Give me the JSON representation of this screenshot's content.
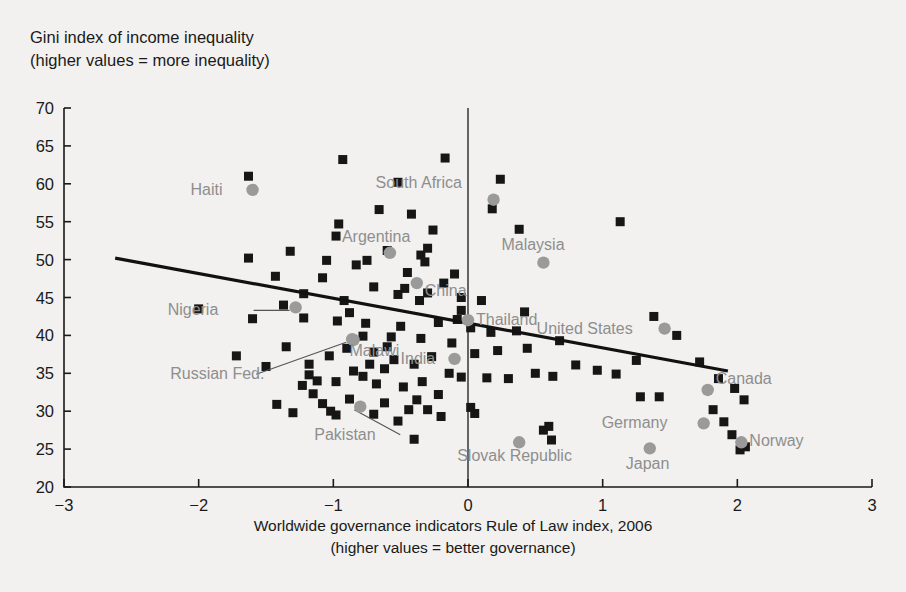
{
  "chart_data": {
    "type": "scatter",
    "title": "",
    "ylabel": "Gini index of income inequality\n(higher values = more inequality)",
    "xlabel": "Worldwide governance indicators Rule of Law index, 2006\n(higher values = better governance)",
    "xlim": [
      -3,
      3
    ],
    "ylim": [
      20,
      70
    ],
    "xticks": [
      -3,
      -2,
      -1,
      0,
      1,
      2,
      3
    ],
    "xtick_labels": [
      "−3",
      "−2",
      "−1",
      "0",
      "1",
      "2",
      "3"
    ],
    "yticks": [
      20,
      25,
      30,
      35,
      40,
      45,
      50,
      55,
      60,
      65,
      70
    ],
    "ytick_labels": [
      "20",
      "25",
      "30",
      "35",
      "40",
      "45",
      "50",
      "55",
      "60",
      "65",
      "70"
    ],
    "grid": false,
    "legend": "none",
    "zero_reference_line_x": 0,
    "trendline": {
      "type": "linear",
      "x_start": -2.62,
      "y_start": 50.2,
      "x_end": 1.93,
      "y_end": 35.3,
      "color": "#111111"
    },
    "marker_colors": {
      "unlabeled": "#161616",
      "highlighted": "#9a9a9a",
      "label_text": "#8e8e8e"
    },
    "labeled_points": [
      {
        "name": "Haiti",
        "x": -1.6,
        "y": 59.2,
        "label_dx": -62,
        "label_dy": 5,
        "anchor": "start",
        "leader": false
      },
      {
        "name": "Argentina",
        "x": -0.58,
        "y": 50.9,
        "label_dx": -48,
        "label_dy": -11,
        "anchor": "start",
        "leader": false
      },
      {
        "name": "South Africa",
        "x": 0.19,
        "y": 57.9,
        "label_dx": -118,
        "label_dy": -12,
        "anchor": "start",
        "leader": false
      },
      {
        "name": "Malaysia",
        "x": 0.56,
        "y": 49.6,
        "label_dx": -42,
        "label_dy": -13,
        "anchor": "start",
        "leader": false
      },
      {
        "name": "China",
        "x": -0.38,
        "y": 46.9,
        "label_dx": 8,
        "label_dy": 13,
        "anchor": "start",
        "leader": false
      },
      {
        "name": "Nigeria",
        "x": -1.28,
        "y": 43.7,
        "label_dx": -128,
        "label_dy": 8,
        "anchor": "start",
        "leader": true
      },
      {
        "name": "Thailand",
        "x": 0.0,
        "y": 42.0,
        "label_dx": 8,
        "label_dy": 5,
        "anchor": "start",
        "leader": false
      },
      {
        "name": "United States",
        "x": 1.46,
        "y": 40.9,
        "label_dx": -128,
        "label_dy": 5,
        "anchor": "start",
        "leader": false
      },
      {
        "name": "Malawi",
        "x": -0.85,
        "y": 39.4,
        "label_dx": -4,
        "label_dy": 16,
        "anchor": "start",
        "leader": false
      },
      {
        "name": "Russian Fed.",
        "x": -0.86,
        "y": 39.5,
        "label_dx": -182,
        "label_dy": 40,
        "anchor": "start",
        "leader": true
      },
      {
        "name": "India",
        "x": -0.1,
        "y": 36.9,
        "label_dx": -54,
        "label_dy": 5,
        "anchor": "start",
        "leader": false
      },
      {
        "name": "Canada",
        "x": 1.78,
        "y": 32.8,
        "label_dx": 8,
        "label_dy": -6,
        "anchor": "start",
        "leader": false
      },
      {
        "name": "Pakistan",
        "x": -0.8,
        "y": 30.6,
        "label_dx": -46,
        "label_dy": 33,
        "anchor": "start",
        "leader": true
      },
      {
        "name": "Germany",
        "x": 1.75,
        "y": 28.4,
        "label_dx": -102,
        "label_dy": 5,
        "anchor": "start",
        "leader": false
      },
      {
        "name": "Norway",
        "x": 2.03,
        "y": 25.9,
        "label_dx": 8,
        "label_dy": 4,
        "anchor": "start",
        "leader": false
      },
      {
        "name": "Slovak Republic",
        "x": 0.38,
        "y": 25.9,
        "label_dx": -62,
        "label_dy": 19,
        "anchor": "start",
        "leader": false
      },
      {
        "name": "Japan",
        "x": 1.35,
        "y": 25.1,
        "label_dx": -24,
        "label_dy": 21,
        "anchor": "start",
        "leader": false
      }
    ],
    "unlabeled_points": [
      [
        -1.63,
        61.0
      ],
      [
        -0.93,
        63.2
      ],
      [
        -0.17,
        63.4
      ],
      [
        -0.52,
        60.2
      ],
      [
        0.24,
        60.6
      ],
      [
        1.13,
        55.0
      ],
      [
        -0.66,
        56.6
      ],
      [
        -0.42,
        56.0
      ],
      [
        -0.96,
        54.7
      ],
      [
        -0.98,
        53.1
      ],
      [
        -0.26,
        53.9
      ],
      [
        -0.6,
        51.2
      ],
      [
        -1.32,
        51.1
      ],
      [
        -1.63,
        50.2
      ],
      [
        -0.35,
        50.6
      ],
      [
        -0.3,
        51.5
      ],
      [
        -0.32,
        49.7
      ],
      [
        -0.75,
        49.9
      ],
      [
        -1.05,
        49.9
      ],
      [
        -0.83,
        49.3
      ],
      [
        -1.43,
        47.8
      ],
      [
        -1.08,
        47.6
      ],
      [
        -0.45,
        48.3
      ],
      [
        -0.1,
        48.1
      ],
      [
        -0.7,
        46.4
      ],
      [
        -0.47,
        46.2
      ],
      [
        -0.52,
        45.4
      ],
      [
        -0.3,
        45.6
      ],
      [
        -0.36,
        44.6
      ],
      [
        -0.18,
        46.9
      ],
      [
        -1.22,
        45.5
      ],
      [
        -1.37,
        44.0
      ],
      [
        -0.92,
        44.6
      ],
      [
        -0.05,
        45.0
      ],
      [
        0.1,
        44.6
      ],
      [
        0.18,
        56.7
      ],
      [
        0.38,
        54.0
      ],
      [
        -2.0,
        43.5
      ],
      [
        -1.6,
        42.2
      ],
      [
        -1.22,
        42.3
      ],
      [
        -0.97,
        41.9
      ],
      [
        -0.76,
        41.6
      ],
      [
        -0.5,
        41.2
      ],
      [
        -0.22,
        41.7
      ],
      [
        0.02,
        41.0
      ],
      [
        0.17,
        40.4
      ],
      [
        0.36,
        40.6
      ],
      [
        0.68,
        39.3
      ],
      [
        0.44,
        38.3
      ],
      [
        0.22,
        38.0
      ],
      [
        0.05,
        37.6
      ],
      [
        -0.12,
        39.0
      ],
      [
        -0.35,
        39.6
      ],
      [
        -0.57,
        39.8
      ],
      [
        -0.78,
        39.9
      ],
      [
        -0.9,
        38.3
      ],
      [
        -1.03,
        37.3
      ],
      [
        -1.35,
        38.5
      ],
      [
        -1.72,
        37.3
      ],
      [
        -1.5,
        35.9
      ],
      [
        -1.18,
        34.8
      ],
      [
        -1.12,
        34.0
      ],
      [
        -0.98,
        33.9
      ],
      [
        -0.73,
        36.2
      ],
      [
        -0.62,
        35.6
      ],
      [
        -0.55,
        36.8
      ],
      [
        -0.4,
        36.2
      ],
      [
        -0.27,
        37.2
      ],
      [
        -0.14,
        35.0
      ],
      [
        -0.05,
        34.5
      ],
      [
        0.14,
        34.4
      ],
      [
        0.3,
        34.3
      ],
      [
        0.5,
        35.0
      ],
      [
        0.63,
        34.6
      ],
      [
        0.8,
        36.1
      ],
      [
        0.96,
        35.4
      ],
      [
        1.1,
        34.9
      ],
      [
        1.25,
        36.7
      ],
      [
        1.38,
        42.5
      ],
      [
        1.55,
        40.0
      ],
      [
        1.72,
        36.5
      ],
      [
        1.86,
        34.3
      ],
      [
        1.98,
        33.0
      ],
      [
        2.05,
        31.5
      ],
      [
        1.82,
        30.2
      ],
      [
        1.9,
        28.6
      ],
      [
        1.96,
        26.9
      ],
      [
        2.06,
        25.3
      ],
      [
        2.02,
        24.9
      ],
      [
        1.42,
        31.9
      ],
      [
        1.28,
        31.9
      ],
      [
        0.56,
        27.5
      ],
      [
        0.62,
        26.2
      ],
      [
        0.6,
        28.0
      ],
      [
        -0.22,
        32.2
      ],
      [
        -0.38,
        31.5
      ],
      [
        -0.44,
        30.2
      ],
      [
        -0.3,
        30.2
      ],
      [
        -0.62,
        31.1
      ],
      [
        -0.7,
        29.6
      ],
      [
        -0.52,
        28.7
      ],
      [
        -0.4,
        26.3
      ],
      [
        -0.88,
        31.6
      ],
      [
        -1.08,
        31.0
      ],
      [
        -1.15,
        32.3
      ],
      [
        -0.98,
        29.5
      ],
      [
        -1.02,
        30.0
      ],
      [
        -1.18,
        36.2
      ],
      [
        -0.85,
        35.3
      ],
      [
        -0.78,
        34.6
      ],
      [
        -0.68,
        33.6
      ],
      [
        -0.48,
        33.2
      ],
      [
        -0.34,
        33.9
      ],
      [
        -0.2,
        29.3
      ],
      [
        -0.6,
        38.5
      ],
      [
        -0.7,
        37.8
      ],
      [
        -1.3,
        29.8
      ],
      [
        -1.42,
        30.9
      ],
      [
        -1.23,
        33.4
      ],
      [
        0.02,
        30.5
      ],
      [
        0.05,
        29.7
      ],
      [
        -0.05,
        43.3
      ],
      [
        -0.08,
        42.1
      ],
      [
        0.42,
        43.1
      ],
      [
        -0.88,
        43.0
      ]
    ]
  },
  "axis_text": {
    "y_axis_title_line1": "Gini index of income inequality",
    "y_axis_title_line2": "(higher values = more inequality)",
    "x_axis_title_line1": "Worldwide governance indicators Rule of Law index, 2006",
    "x_axis_title_line2": "(higher values = better governance)"
  }
}
